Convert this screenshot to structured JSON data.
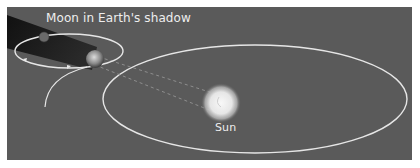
{
  "diagram": {
    "title_label": "Moon in Earth's shadow",
    "sun_label": "Sun",
    "objects": [
      {
        "name": "Sun",
        "role": "central star"
      },
      {
        "name": "Earth",
        "role": "orbits Sun"
      },
      {
        "name": "Moon",
        "role": "orbits Earth, inside Earth's shadow"
      }
    ],
    "elements": {
      "earth_orbit": "large ellipse around the Sun",
      "moon_orbit": "small ellipse around Earth with direction arrows",
      "shadow": "Earth's shadow cone extending away from the Sun",
      "sightlines": "dashed lines from Earth toward the Sun"
    },
    "colors": {
      "background": "#5a5a5a",
      "orbit_lines": "#e8e8e8",
      "shadow": "#1a1a1a",
      "sun_glow": "#f4f4f4",
      "text": "#eeeeee"
    }
  }
}
